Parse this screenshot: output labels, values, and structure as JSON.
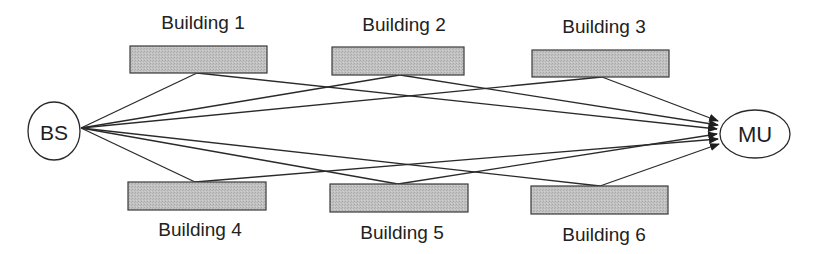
{
  "diagram": {
    "colors": {
      "line": "#2a2a2a",
      "building_fill": "#bdbdbd",
      "building_stroke": "#3a3a3a",
      "node_fill": "#ffffff",
      "text": "#222222"
    },
    "nodes": [
      {
        "id": "bs",
        "label": "BS",
        "cx": 54,
        "cy": 131,
        "rx": 26,
        "ry": 29
      },
      {
        "id": "mu",
        "label": "MU",
        "cx": 755,
        "cy": 134,
        "rx": 35,
        "ry": 24
      }
    ],
    "buildings": [
      {
        "id": "b1",
        "label": "Building 1",
        "x": 130,
        "y": 46,
        "w": 137,
        "h": 27,
        "label_x": 203,
        "label_y": 13,
        "reflect_x": 197,
        "reflect_y": 73
      },
      {
        "id": "b2",
        "label": "Building 2",
        "x": 332,
        "y": 47,
        "w": 132,
        "h": 28,
        "label_x": 404,
        "label_y": 15,
        "reflect_x": 400,
        "reflect_y": 75
      },
      {
        "id": "b3",
        "label": "Building 3",
        "x": 532,
        "y": 50,
        "w": 137,
        "h": 27,
        "label_x": 604,
        "label_y": 17,
        "reflect_x": 602,
        "reflect_y": 77
      },
      {
        "id": "b4",
        "label": "Building 4",
        "x": 128,
        "y": 182,
        "w": 138,
        "h": 28,
        "label_x": 200,
        "label_y": 220,
        "reflect_x": 195,
        "reflect_y": 182
      },
      {
        "id": "b5",
        "label": "Building 5",
        "x": 330,
        "y": 184,
        "w": 138,
        "h": 28,
        "label_x": 402,
        "label_y": 223,
        "reflect_x": 398,
        "reflect_y": 184
      },
      {
        "id": "b6",
        "label": "Building 6",
        "x": 531,
        "y": 186,
        "w": 137,
        "h": 28,
        "label_x": 604,
        "label_y": 225,
        "reflect_x": 600,
        "reflect_y": 186
      }
    ],
    "source_point": {
      "x": 81,
      "y": 128
    },
    "arrow_tips": [
      {
        "x": 718,
        "y": 121
      },
      {
        "x": 718,
        "y": 125
      },
      {
        "x": 717,
        "y": 129
      },
      {
        "x": 717,
        "y": 134
      },
      {
        "x": 718,
        "y": 139
      },
      {
        "x": 719,
        "y": 144
      }
    ]
  }
}
